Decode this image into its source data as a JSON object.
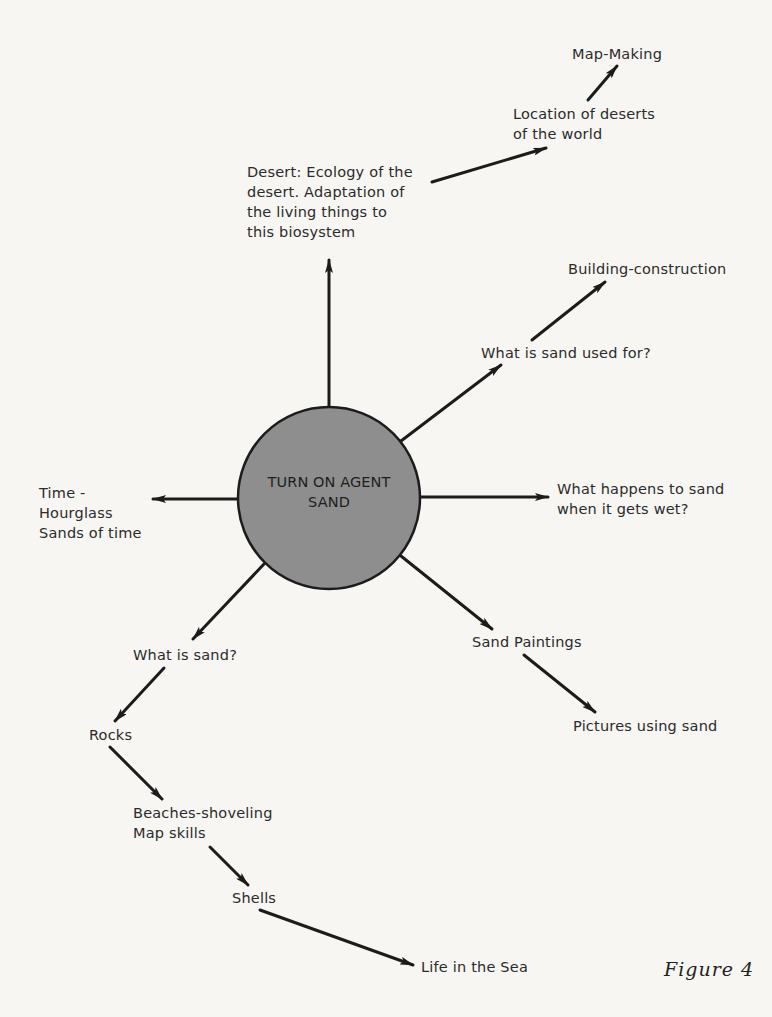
{
  "hub": {
    "line1": "TURN ON AGENT",
    "line2": "SAND",
    "fill": "#8e8e8e"
  },
  "nodes": {
    "desert": [
      "Desert: Ecology of the",
      "desert. Adaptation of",
      "the living things to",
      "this biosystem"
    ],
    "location": [
      "Location of deserts",
      "of the world"
    ],
    "map_making": "Map-Making",
    "used_for": "What is sand used for?",
    "building": "Building-construction",
    "wet": [
      "What happens to sand",
      "when it gets wet?"
    ],
    "time": [
      "Time -",
      "Hourglass",
      "Sands of time"
    ],
    "paintings": "Sand Paintings",
    "pictures": "Pictures using sand",
    "what_is": "What is sand?",
    "rocks": "Rocks",
    "beaches": [
      "Beaches-shoveling",
      "Map skills"
    ],
    "shells": "Shells",
    "life_sea": "Life in the Sea"
  },
  "caption": "Figure 4",
  "edges": [
    {
      "from": "hub",
      "to": "desert"
    },
    {
      "from": "desert",
      "to": "location"
    },
    {
      "from": "location",
      "to": "map_making"
    },
    {
      "from": "hub",
      "to": "used_for"
    },
    {
      "from": "used_for",
      "to": "building"
    },
    {
      "from": "hub",
      "to": "wet"
    },
    {
      "from": "hub",
      "to": "time"
    },
    {
      "from": "hub",
      "to": "paintings"
    },
    {
      "from": "paintings",
      "to": "pictures"
    },
    {
      "from": "hub",
      "to": "what_is"
    },
    {
      "from": "what_is",
      "to": "rocks"
    },
    {
      "from": "rocks",
      "to": "beaches"
    },
    {
      "from": "beaches",
      "to": "shells"
    },
    {
      "from": "shells",
      "to": "life_sea"
    }
  ]
}
